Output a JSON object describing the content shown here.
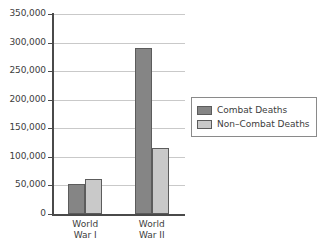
{
  "chart_data": {
    "type": "bar",
    "title": "",
    "subtitle": "",
    "xlabel": "",
    "ylabel": "",
    "categories": [
      "World War I",
      "World War II"
    ],
    "category_lines": [
      [
        "World",
        "War I"
      ],
      [
        "World",
        "War II"
      ]
    ],
    "series": [
      {
        "name": "Combat Deaths",
        "values": [
          53000,
          291000
        ],
        "color": "#858585"
      },
      {
        "name": "Non–Combat Deaths",
        "values": [
          62000,
          115000
        ],
        "color": "#c9c9c9"
      }
    ],
    "ylim": [
      0,
      350000
    ],
    "ytick_values": [
      0,
      50000,
      100000,
      150000,
      200000,
      250000,
      300000,
      350000
    ],
    "ytick_labels": [
      "0",
      "50,000",
      "100,000",
      "150,000",
      "200,000",
      "250,000",
      "300,000",
      "350,000"
    ],
    "grid": true,
    "grid_axis": "y",
    "legend_position": "right",
    "legend_border": true,
    "bar_border_color": "#5c5c5c",
    "axis_color": "#4a4a4a",
    "grid_color": "#c9c9c9",
    "background": "#ffffff"
  }
}
